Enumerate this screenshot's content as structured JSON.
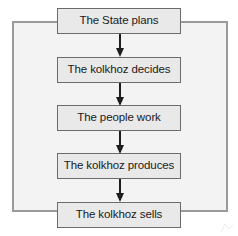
{
  "figure": {
    "type": "flowchart",
    "orientation": "vertical",
    "title": "",
    "colors": {
      "page_background": "#ffffff",
      "loop_fill": "#f3f3f3",
      "loop_stroke": "#9a9a9a",
      "node_fill": "#e9e9e9",
      "node_stroke": "#6b6b6b",
      "arrow": "#1d1d1d",
      "text": "#1a1a1a"
    },
    "loop": {
      "name": "feedback-loop",
      "description": "outer rectangle linking the last step back to the first step"
    },
    "nodes": [
      {
        "id": "n0",
        "label": "The State plans"
      },
      {
        "id": "n1",
        "label": "The kolkhoz decides"
      },
      {
        "id": "n2",
        "label": "The people work"
      },
      {
        "id": "n3",
        "label": "The kolkhoz produces"
      },
      {
        "id": "n4",
        "label": "The kolkhoz sells"
      }
    ],
    "arrows": [
      {
        "id": "a0",
        "from": "n0",
        "to": "n1",
        "glyph": "down-arrow"
      },
      {
        "id": "a1",
        "from": "n1",
        "to": "n2",
        "glyph": "down-arrow"
      },
      {
        "id": "a2",
        "from": "n2",
        "to": "n3",
        "glyph": "down-arrow"
      },
      {
        "id": "a3",
        "from": "n3",
        "to": "n4",
        "glyph": "down-arrow"
      }
    ]
  }
}
